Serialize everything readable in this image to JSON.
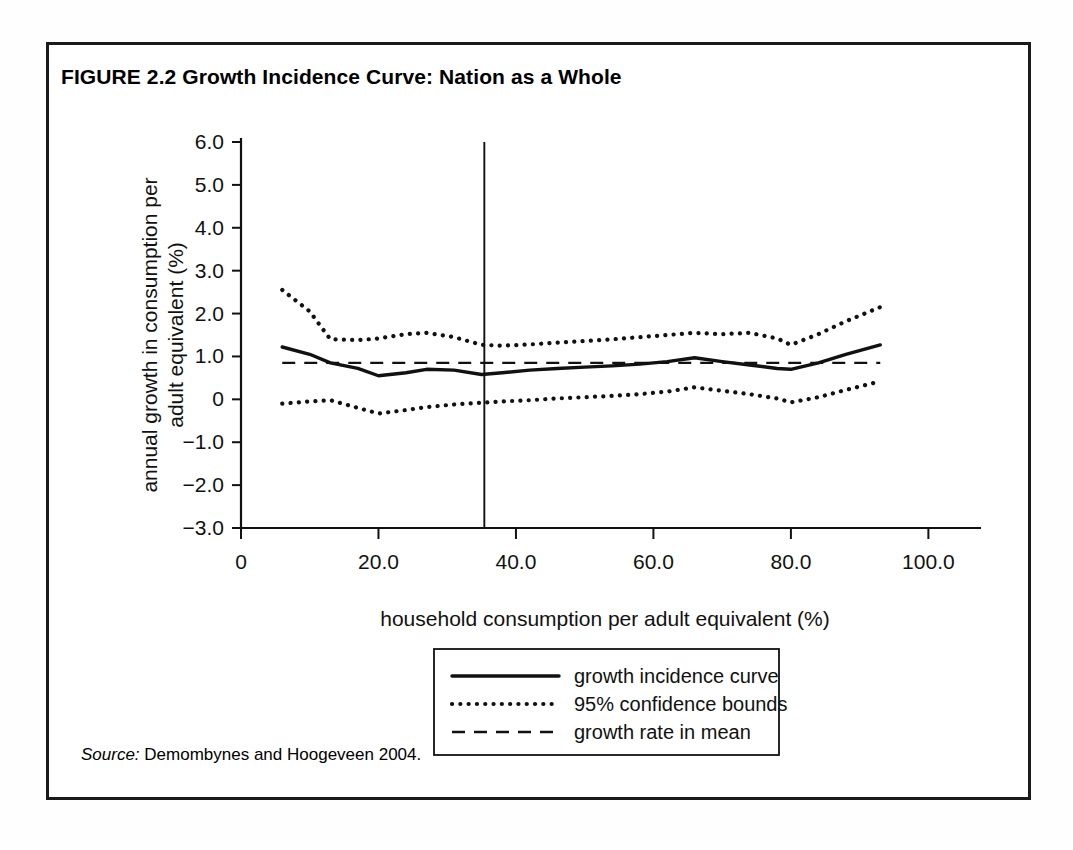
{
  "figure": {
    "title": "FIGURE 2.2  Growth Incidence Curve: Nation as a Whole",
    "source_label": "Source:",
    "source_text": " Demombynes and Hoogeveen 2004."
  },
  "chart_data": {
    "type": "line",
    "title": "Growth Incidence Curve: Nation as a Whole",
    "xlabel": "household consumption per adult equivalent (%)",
    "ylabel": "annual growth in consumption per adult equivalent (%)",
    "ylabel_line1": "annual growth in consumption per",
    "ylabel_line2": "adult equivalent (%)",
    "xlim": [
      0,
      100
    ],
    "ylim": [
      -3.0,
      6.0
    ],
    "grid": false,
    "legend_position": "below-plot-center",
    "xticks": [
      0,
      20,
      40,
      60,
      80,
      100
    ],
    "xtick_labels": [
      "0",
      "20.0",
      "40.0",
      "60.0",
      "80.0",
      "100.0"
    ],
    "yticks": [
      -3.0,
      -2.0,
      -1.0,
      0,
      1.0,
      2.0,
      3.0,
      4.0,
      5.0,
      6.0
    ],
    "ytick_labels": [
      "−3.0",
      "−2.0",
      "−1.0",
      "0",
      "1.0",
      "2.0",
      "3.0",
      "4.0",
      "5.0",
      "6.0"
    ],
    "annotations": [
      {
        "name": "poverty-line-marker",
        "type": "vertical-line",
        "x": 35.4,
        "y_from": -3.0,
        "y_to": 6.0
      }
    ],
    "x": [
      6,
      10,
      13,
      17,
      20,
      24,
      27,
      31,
      35,
      38,
      42,
      46,
      50,
      54,
      58,
      62,
      66,
      70,
      74,
      78,
      80,
      84,
      88,
      93
    ],
    "series": [
      {
        "name": "growth incidence curve",
        "style": "solid",
        "values": [
          1.22,
          1.05,
          0.85,
          0.72,
          0.55,
          0.62,
          0.7,
          0.68,
          0.58,
          0.62,
          0.68,
          0.72,
          0.75,
          0.78,
          0.82,
          0.88,
          0.97,
          0.88,
          0.8,
          0.72,
          0.7,
          0.85,
          1.05,
          1.27
        ]
      },
      {
        "name": "95% confidence upper bound",
        "style": "dotted",
        "values": [
          2.55,
          2.05,
          1.4,
          1.38,
          1.42,
          1.52,
          1.55,
          1.45,
          1.27,
          1.25,
          1.28,
          1.32,
          1.36,
          1.4,
          1.45,
          1.5,
          1.55,
          1.52,
          1.55,
          1.42,
          1.27,
          1.52,
          1.82,
          2.15
        ]
      },
      {
        "name": "95% confidence lower bound",
        "style": "dotted",
        "values": [
          -0.1,
          -0.05,
          -0.02,
          -0.2,
          -0.33,
          -0.25,
          -0.18,
          -0.12,
          -0.08,
          -0.05,
          -0.02,
          0.02,
          0.05,
          0.08,
          0.12,
          0.18,
          0.28,
          0.2,
          0.12,
          0.02,
          -0.07,
          0.05,
          0.22,
          0.42
        ]
      },
      {
        "name": "growth rate in mean",
        "style": "dashed",
        "constant": 0.85,
        "values": [
          0.85,
          0.85,
          0.85,
          0.85,
          0.85,
          0.85,
          0.85,
          0.85,
          0.85,
          0.85,
          0.85,
          0.85,
          0.85,
          0.85,
          0.85,
          0.85,
          0.85,
          0.85,
          0.85,
          0.85,
          0.85,
          0.85,
          0.85,
          0.85
        ]
      }
    ],
    "legend": [
      {
        "label": "growth incidence curve",
        "style": "solid"
      },
      {
        "label": "95% confidence bounds",
        "style": "dotted"
      },
      {
        "label": "growth rate in mean",
        "style": "dashed"
      }
    ]
  }
}
